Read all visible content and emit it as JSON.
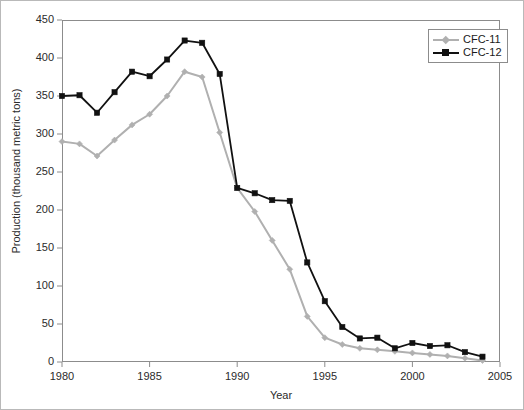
{
  "chart_data": {
    "type": "line",
    "title": "",
    "xlabel": "Year",
    "ylabel": "Production (thousand metric tons)",
    "xlim": [
      1980,
      2005
    ],
    "ylim": [
      0,
      450
    ],
    "xticks": [
      1980,
      1985,
      1990,
      1995,
      2000,
      2005
    ],
    "yticks": [
      0,
      50,
      100,
      150,
      200,
      250,
      300,
      350,
      400,
      450
    ],
    "grid": false,
    "legend_position": "top-right",
    "x": [
      1980,
      1981,
      1982,
      1983,
      1984,
      1985,
      1986,
      1987,
      1988,
      1989,
      1990,
      1991,
      1992,
      1993,
      1994,
      1995,
      1996,
      1997,
      1998,
      1999,
      2000,
      2001,
      2002,
      2003,
      2004
    ],
    "series": [
      {
        "name": "CFC-11",
        "color": "#b0b0b0",
        "marker": "diamond",
        "values": [
          290,
          287,
          271,
          292,
          312,
          326,
          350,
          382,
          375,
          302,
          229,
          198,
          160,
          122,
          60,
          32,
          23,
          18,
          16,
          14,
          12,
          10,
          8,
          5,
          2
        ]
      },
      {
        "name": "CFC-12",
        "color": "#111111",
        "marker": "square",
        "values": [
          350,
          351,
          328,
          355,
          382,
          376,
          398,
          423,
          420,
          379,
          229,
          222,
          213,
          212,
          131,
          80,
          46,
          31,
          32,
          18,
          25,
          21,
          22,
          13,
          7
        ]
      }
    ]
  },
  "legend": {
    "items": [
      {
        "label": "CFC-11"
      },
      {
        "label": "CFC-12"
      }
    ]
  },
  "axes": {
    "y_title": "Production (thousand metric tons)",
    "x_title": "Year",
    "y_ticks": [
      "450",
      "400",
      "350",
      "300",
      "250",
      "200",
      "150",
      "100",
      "50",
      "0"
    ],
    "x_ticks": [
      "1980",
      "1985",
      "1990",
      "1995",
      "2000",
      "2005"
    ]
  },
  "colors": {
    "series_cfc11": "#b0b0b0",
    "series_cfc12": "#111111",
    "axis": "#8c8c8c",
    "text": "#2b2b2b",
    "background": "#ffffff"
  }
}
